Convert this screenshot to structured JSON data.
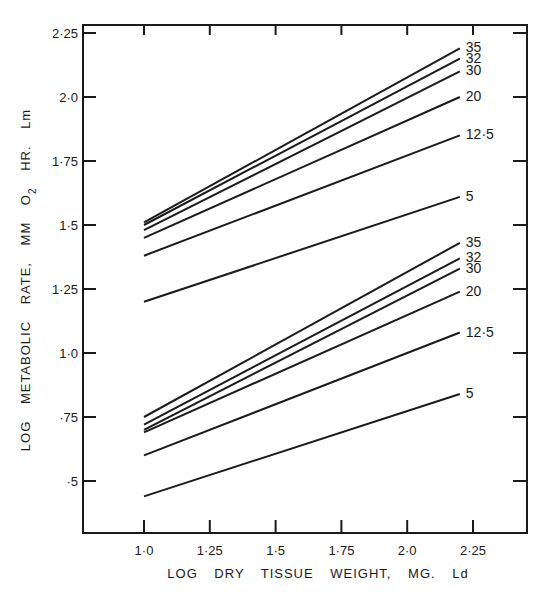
{
  "chart_data": {
    "type": "line",
    "title": "",
    "xlabel": "LOG   DRY   TISSUE   WEIGHT, MG. Ld",
    "ylabel": "LOG   METABOLIC   RATE,  MM  O2  HR.  Lm",
    "xlim": [
      0.75,
      2.4
    ],
    "ylim": [
      0.32,
      2.28
    ],
    "x_ticks": [
      "1·0",
      "1·25",
      "1·5",
      "1·75",
      "2·0",
      "2·25"
    ],
    "x_tick_values": [
      1.0,
      1.25,
      1.5,
      1.75,
      2.0,
      2.25
    ],
    "y_ticks": [
      "2·25",
      "2·0",
      "1·75",
      "1·5",
      "1·25",
      "1·0",
      "·75",
      "·5"
    ],
    "y_tick_values": [
      2.25,
      2.0,
      1.75,
      1.5,
      1.25,
      1.0,
      0.75,
      0.5
    ],
    "grid": false,
    "legend": "inline labels at right end of each line",
    "groups": [
      {
        "name": "upper group",
        "series": [
          {
            "name": "35",
            "x": [
              1.0,
              2.2
            ],
            "values": [
              1.51,
              2.19
            ]
          },
          {
            "name": "32",
            "x": [
              1.0,
              2.2
            ],
            "values": [
              1.5,
              2.15
            ]
          },
          {
            "name": "30",
            "x": [
              1.0,
              2.2
            ],
            "values": [
              1.48,
              2.1
            ]
          },
          {
            "name": "20",
            "x": [
              1.0,
              2.2
            ],
            "values": [
              1.45,
              2.0
            ]
          },
          {
            "name": "12·5",
            "x": [
              1.0,
              2.2
            ],
            "values": [
              1.38,
              1.85
            ]
          },
          {
            "name": "5",
            "x": [
              1.0,
              2.2
            ],
            "values": [
              1.2,
              1.61
            ]
          }
        ]
      },
      {
        "name": "lower group",
        "series": [
          {
            "name": "35",
            "x": [
              1.0,
              2.2
            ],
            "values": [
              0.75,
              1.43
            ]
          },
          {
            "name": "32",
            "x": [
              1.0,
              2.2
            ],
            "values": [
              0.72,
              1.37
            ]
          },
          {
            "name": "30",
            "x": [
              1.0,
              2.2
            ],
            "values": [
              0.7,
              1.33
            ]
          },
          {
            "name": "20",
            "x": [
              1.0,
              2.2
            ],
            "values": [
              0.69,
              1.24
            ]
          },
          {
            "name": "12·5",
            "x": [
              1.0,
              2.2
            ],
            "values": [
              0.6,
              1.08
            ]
          },
          {
            "name": "5",
            "x": [
              1.0,
              2.2
            ],
            "values": [
              0.44,
              0.84
            ]
          }
        ]
      }
    ]
  },
  "colors": {
    "line": "#1a1a1a",
    "background": "#ffffff"
  }
}
